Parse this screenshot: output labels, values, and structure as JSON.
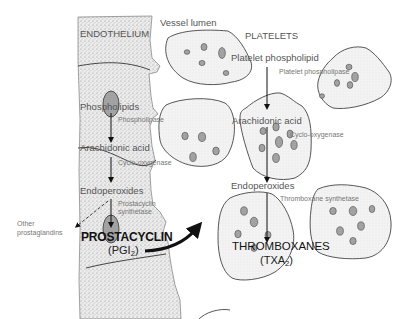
{
  "diagram": {
    "regions": {
      "endothelium": "ENDOTHELIUM",
      "vessel_lumen": "Vessel lumen",
      "platelets": "PLATELETS"
    },
    "endothelial_pathway": {
      "substrate": "Phospholipids",
      "enzyme1": "Phospholipase",
      "intermediate1": "Arachidonic acid",
      "enzyme2": "Cyclo-oxygenase",
      "intermediate2": "Endoperoxides",
      "enzyme3_line1": "Prostacyclin",
      "enzyme3_line2": "synthetase",
      "side_product_line1": "Other",
      "side_product_line2": "prostaglandins",
      "product": "PROSTACYCLIN",
      "product_abbrev_prefix": "(PGI",
      "product_abbrev_sub": "2",
      "product_abbrev_suffix": ")"
    },
    "platelet_pathway": {
      "substrate": "Platelet phospholipid",
      "enzyme1": "Platelet phospholipase",
      "intermediate1": "Arachidonic acid",
      "enzyme2": "Cyclo-oxygenase",
      "intermediate2": "Endoperoxides",
      "enzyme3": "Thromboxane synthetase",
      "product": "THROMBOXANES",
      "product_abbrev_prefix": "(TXA",
      "product_abbrev_sub": "2",
      "product_abbrev_suffix": ")"
    },
    "colors": {
      "stipple_bg": "#e4e4e4",
      "outline": "#444444",
      "platelet_fill": "#f1f1f1",
      "arrow": "#111111",
      "text_dark": "#111111",
      "text_light": "#777777"
    }
  }
}
